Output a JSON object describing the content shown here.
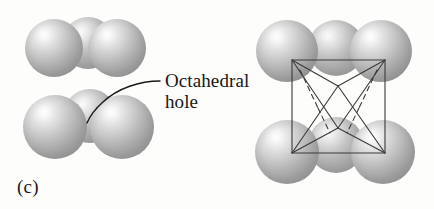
{
  "figure": {
    "panel_label": "(c)",
    "background_color": "#fdfdfc",
    "callout": {
      "line1": "Octahedral",
      "line2": "hole",
      "text_color": "#171717"
    },
    "line_color": "#3a3a3a",
    "leader_color": "#1a1a1a",
    "sphere_color_light": "#ffffff",
    "sphere_color_mid": "#bcbcbc",
    "sphere_color_dark": "#8e8e8e"
  },
  "left_cluster": {
    "name": "close-packed-spheres-left",
    "top_layer": [
      {
        "cx": 54,
        "cy": 48,
        "r": 29,
        "depth": "front"
      },
      {
        "cx": 88,
        "cy": 43,
        "r": 26,
        "depth": "back"
      },
      {
        "cx": 117,
        "cy": 48,
        "r": 29,
        "depth": "front"
      }
    ],
    "bottom_layer": [
      {
        "cx": 55,
        "cy": 127,
        "r": 32,
        "depth": "front"
      },
      {
        "cx": 90,
        "cy": 116,
        "r": 27,
        "depth": "back"
      },
      {
        "cx": 122,
        "cy": 127,
        "r": 32,
        "depth": "front"
      }
    ]
  },
  "right_cluster": {
    "name": "close-packed-spheres-right",
    "top_layer": [
      {
        "cx": 287,
        "cy": 51,
        "r": 31,
        "depth": "front"
      },
      {
        "cx": 336,
        "cy": 48,
        "r": 28,
        "depth": "back"
      },
      {
        "cx": 381,
        "cy": 51,
        "r": 31,
        "depth": "front"
      }
    ],
    "bottom_layer": [
      {
        "cx": 287,
        "cy": 152,
        "r": 32,
        "depth": "front"
      },
      {
        "cx": 336,
        "cy": 145,
        "r": 28,
        "depth": "back"
      },
      {
        "cx": 383,
        "cy": 152,
        "r": 32,
        "depth": "front"
      }
    ]
  },
  "octahedron": {
    "name": "octahedron-wireframe",
    "square": {
      "x1": 292,
      "y1": 60,
      "x2": 385,
      "y2": 153
    },
    "apex_top": {
      "x": 338,
      "y": 86
    },
    "apex_bottom": {
      "x": 338,
      "y": 128
    },
    "solid_edges": 8,
    "dashed_edges": 4,
    "stroke_color": "#3a3a3a",
    "stroke_width": 1.1
  }
}
